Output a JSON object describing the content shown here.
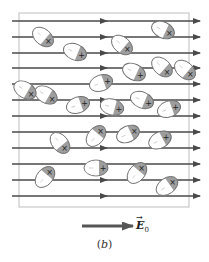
{
  "figure": {
    "caption": "(b)",
    "caption_letter": "b",
    "field_label": "E",
    "field_subscript": "0",
    "field_vector_symbol": "E-naught-vector"
  },
  "colors": {
    "field_line": "#4a4a4a",
    "box_border": "#bdbdbd",
    "molecule_outline": "#6d6d6d",
    "molecule_shaded": "#9e9e9e",
    "molecule_fill": "#ffffff"
  },
  "field_lines_y": [
    21,
    37,
    53,
    68,
    84,
    100,
    116,
    132,
    148,
    164,
    180,
    196
  ],
  "molecules": [
    {
      "cx": 43,
      "cy": 37,
      "angle": 40,
      "sign": "×"
    },
    {
      "cx": 75,
      "cy": 52,
      "angle": 22,
      "sign": "+"
    },
    {
      "cx": 163,
      "cy": 30,
      "angle": 25,
      "sign": "×"
    },
    {
      "cx": 122,
      "cy": 45,
      "angle": 40,
      "sign": "×"
    },
    {
      "cx": 162,
      "cy": 67,
      "angle": 42,
      "sign": "×"
    },
    {
      "cx": 134,
      "cy": 72,
      "angle": 25,
      "sign": "+"
    },
    {
      "cx": 101,
      "cy": 83,
      "angle": -20,
      "sign": "+"
    },
    {
      "cx": 46,
      "cy": 95,
      "angle": 30,
      "sign": "×"
    },
    {
      "cx": 78,
      "cy": 105,
      "angle": -20,
      "sign": "+"
    },
    {
      "cx": 112,
      "cy": 107,
      "angle": 15,
      "sign": "+"
    },
    {
      "cx": 142,
      "cy": 100,
      "angle": 22,
      "sign": "+"
    },
    {
      "cx": 169,
      "cy": 109,
      "angle": -20,
      "sign": "+"
    },
    {
      "cx": 60,
      "cy": 143,
      "angle": 50,
      "sign": "×"
    },
    {
      "cx": 96,
      "cy": 136,
      "angle": -50,
      "sign": "×"
    },
    {
      "cx": 128,
      "cy": 134,
      "angle": -25,
      "sign": "×"
    },
    {
      "cx": 160,
      "cy": 140,
      "angle": -28,
      "sign": "+"
    },
    {
      "cx": 96,
      "cy": 168,
      "angle": 0,
      "sign": "+"
    },
    {
      "cx": 137,
      "cy": 173,
      "angle": -50,
      "sign": "×"
    },
    {
      "cx": 45,
      "cy": 177,
      "angle": -50,
      "sign": "×"
    },
    {
      "cx": 167,
      "cy": 186,
      "angle": -35,
      "sign": "×"
    },
    {
      "cx": 25,
      "cy": 90,
      "angle": 30,
      "sign": "×"
    },
    {
      "cx": 185,
      "cy": 70,
      "angle": 40,
      "sign": "×"
    }
  ]
}
